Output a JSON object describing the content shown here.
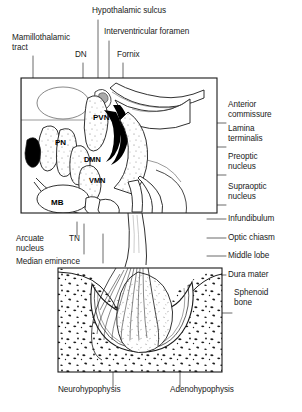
{
  "figure": {
    "line_color": "#1a1a1a",
    "fill_white": "#ffffff",
    "fill_black": "#000000",
    "stipple_color": "#6e6e6e"
  },
  "labels_top": [
    {
      "name": "hypothalamic-sulcus",
      "text": "Hypothalamic sulcus",
      "x": 92,
      "y": 10,
      "leader_x": 98,
      "leader_y1": 20,
      "leader_y2": 78
    },
    {
      "name": "interventricular-foramen",
      "text": "Interventricular foramen",
      "x": 105,
      "y": 31,
      "leader_x": 109,
      "leader_y1": 41,
      "leader_y2": 78
    },
    {
      "name": "mamillothalamic-tract",
      "text": "Mamillothalamic\ntract",
      "line1": "Mamillothalamic",
      "line2": "tract",
      "x": 12,
      "y": 33,
      "leader_x": 33,
      "leader_y1": 56,
      "leader_y2": 78
    },
    {
      "name": "dn",
      "text": "DN",
      "x": 76,
      "y": 52,
      "leader_x": 83,
      "leader_y1": 63,
      "leader_y2": 95
    },
    {
      "name": "fornix",
      "text": "Fornix",
      "x": 118,
      "y": 52,
      "leader_x": 123,
      "leader_y1": 63,
      "leader_y2": 88
    }
  ],
  "labels_right": [
    {
      "name": "anterior-commissure",
      "line1": "Anterior",
      "line2": "commissure",
      "x": 228,
      "y": 104,
      "leader_y": 123,
      "leader_x1": 207,
      "leader_x2": 226
    },
    {
      "name": "lamina-terminalis",
      "line1": "Lamina",
      "line2": "terminalis",
      "x": 228,
      "y": 128,
      "leader_y": 147,
      "leader_x1": 207,
      "leader_x2": 226
    },
    {
      "name": "preoptic-nucleus",
      "line1": "Preoptic",
      "line2": "nucleus",
      "x": 228,
      "y": 156,
      "leader_y": 175,
      "leader_x1": 207,
      "leader_x2": 226
    },
    {
      "name": "supraoptic-nucleus",
      "line1": "Supraoptic",
      "line2": "nucleus",
      "x": 228,
      "y": 186,
      "leader_y": 205,
      "leader_x1": 207,
      "leader_x2": 226
    },
    {
      "name": "infundibulum",
      "line1": "Infundibulum",
      "line2": "",
      "x": 228,
      "y": 215,
      "leader_y": 219,
      "leader_x1": 207,
      "leader_x2": 226
    },
    {
      "name": "optic-chiasm",
      "line1": "Optic chiasm",
      "line2": "",
      "x": 228,
      "y": 234,
      "leader_y": 238,
      "leader_x1": 207,
      "leader_x2": 226
    },
    {
      "name": "middle-lobe",
      "line1": "Middle lobe",
      "line2": "",
      "x": 228,
      "y": 252,
      "leader_y": 256,
      "leader_x1": 207,
      "leader_x2": 226
    },
    {
      "name": "dura-mater",
      "line1": "Dura mater",
      "line2": "",
      "x": 228,
      "y": 271,
      "leader_y": 275,
      "leader_x1": 212,
      "leader_x2": 226
    },
    {
      "name": "sphenoid-bone",
      "line1": "Sphenoid",
      "line2": "bone",
      "x": 234,
      "y": 288,
      "leader_y": 313,
      "leader_x1": 222,
      "leader_x2": 232
    }
  ],
  "labels_left": [
    {
      "name": "arcuate-nucleus",
      "line1": "Arcuate",
      "line2": "nucleus",
      "x": 16,
      "y": 237,
      "leader_x": 84,
      "leader_y1": 224,
      "leader_y2": 254
    },
    {
      "name": "median-eminence",
      "line1": "Median eminence",
      "line2": "",
      "x": 16,
      "y": 258,
      "leader_x": 103,
      "leader_y1": 234,
      "leader_y2": 263
    },
    {
      "name": "tn",
      "line1": "TN",
      "line2": "",
      "x": 70,
      "y": 237,
      "leader_x": 77,
      "leader_y1": 222,
      "leader_y2": 236
    }
  ],
  "labels_bottom": [
    {
      "name": "neurohypophysis",
      "text": "Neurohypophysis",
      "x": 58,
      "y": 389,
      "leader_x": 113,
      "leader_y1": 285,
      "leader_y2": 387
    },
    {
      "name": "adenohypophysis",
      "text": "Adenohypophysis",
      "x": 172,
      "y": 389,
      "leader_x": 180,
      "leader_y1": 300,
      "leader_y2": 387
    }
  ],
  "nuclei_labels": [
    {
      "name": "pvn",
      "text": "PVN",
      "x": 93,
      "y": 118
    },
    {
      "name": "pn",
      "text": "PN",
      "x": 56,
      "y": 143
    },
    {
      "name": "dmn",
      "text": "DMN",
      "x": 86,
      "y": 160
    },
    {
      "name": "vmn",
      "text": "VMN",
      "x": 90,
      "y": 181
    },
    {
      "name": "mb",
      "text": "MB",
      "x": 52,
      "y": 203
    }
  ],
  "panels": {
    "upper": {
      "name": "hypothalamus-panel",
      "x": 21,
      "y": 78,
      "w": 196,
      "h": 135
    },
    "lower": {
      "name": "sphenoid-panel",
      "x": 58,
      "y": 268,
      "w": 164,
      "h": 104
    }
  }
}
